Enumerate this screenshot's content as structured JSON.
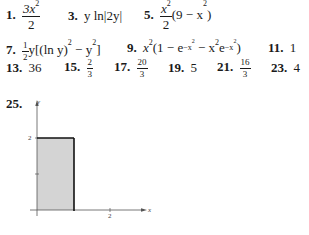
{
  "answers": [
    {
      "number": "1.",
      "num_expr": "3x",
      "num_exp": "2",
      "den": "2"
    },
    {
      "number": "3.",
      "expr": "y ln|2y|"
    },
    {
      "number": "5.",
      "num_expr": "x",
      "num_exp": "2",
      "den": "2",
      "tail": "(9 − x",
      "tail_exp": "2",
      "tail_end": ")"
    },
    {
      "number": "7.",
      "frac_n": "1",
      "frac_d": "2",
      "expr": "y[(ln y)",
      "exp1": "2",
      "mid": " − y",
      "exp2": "2",
      "end": "]"
    },
    {
      "number": "9.",
      "expr": "x",
      "exp": "2",
      "body1": "(1 − e",
      "e1": "−x",
      "e1b": "2",
      "body2": " − x",
      "exp3": "2",
      "body3": "e",
      "e2": "−x",
      "e2b": "2",
      "end": ")"
    },
    {
      "number": "11.",
      "value": "1"
    },
    {
      "number": "13.",
      "value": "36"
    },
    {
      "number": "15.",
      "frac_n": "2",
      "frac_d": "3"
    },
    {
      "number": "17.",
      "frac_n": "20",
      "frac_d": "3"
    },
    {
      "number": "19.",
      "value": "5"
    },
    {
      "number": "21.",
      "frac_n": "16",
      "frac_d": "3"
    },
    {
      "number": "23.",
      "value": "4"
    },
    {
      "number": "25."
    }
  ],
  "graph": {
    "y_axis_label": "y",
    "x_axis_label": "x",
    "y_tick_label": "2",
    "x_tick_label": "2",
    "fill_color": "#d4d4d4",
    "edge_color": "#111111",
    "axis_color": "#555555"
  }
}
